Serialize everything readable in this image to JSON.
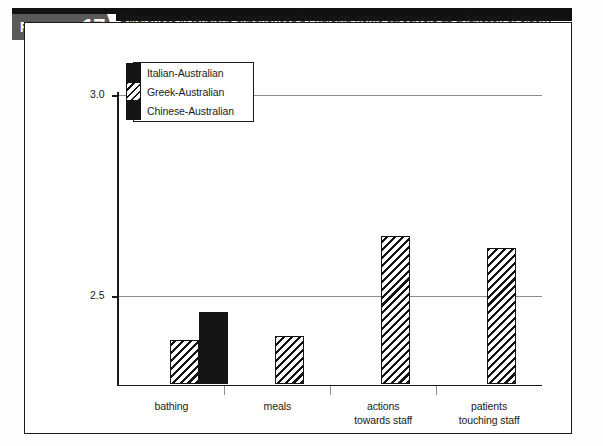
{
  "figure": {
    "badge_word": "FIGURE",
    "badge_number": "17.7",
    "caption": "Differences in tensions experienced by nursing-home caregivers as a function of elderly Australian residents' ethnicity"
  },
  "colors": {
    "series_solid": "#141414",
    "series_hatch_line": "#141414",
    "gridline": "#8d8d8d",
    "axis": "#1a1a1a",
    "badge_bg": "#5a5a5a",
    "header_band": "#111111"
  },
  "legend": {
    "items": [
      {
        "label": "Italian-Australian",
        "pattern": "solid"
      },
      {
        "label": "Greek-Australian",
        "pattern": "hatch"
      },
      {
        "label": "Chinese-Australian",
        "pattern": "solid"
      }
    ]
  },
  "axes": {
    "y_title": "mean score (frequency)",
    "y_ticks": [
      "3.0",
      "2.5",
      "2.0"
    ],
    "y_tick_values": [
      3.0,
      2.5,
      2.0
    ]
  },
  "chart_data": {
    "type": "bar",
    "title": "Differences in tensions experienced by nursing-home caregivers as a function of elderly Australian residents' ethnicity",
    "xlabel": "",
    "ylabel": "mean score (frequency)",
    "ylim": [
      1.8,
      3.05
    ],
    "yticks": [
      2.0,
      2.5,
      3.0
    ],
    "grid": true,
    "legend_position": "top-left inside plot",
    "categories": [
      "bathing",
      "meals",
      "actions towards staff",
      "patients touching staff"
    ],
    "category_lines": [
      [
        "bathing"
      ],
      [
        "meals"
      ],
      [
        "actions",
        "towards staff"
      ],
      [
        "patients",
        "touching staff"
      ]
    ],
    "series": [
      {
        "name": "Italian-Australian",
        "pattern": "solid",
        "values": [
          2.1,
          2.04,
          2.07,
          2.1
        ]
      },
      {
        "name": "Greek-Australian",
        "pattern": "hatch",
        "values": [
          2.39,
          2.4,
          2.65,
          2.62
        ]
      },
      {
        "name": "Chinese-Australian",
        "pattern": "solid",
        "values": [
          2.46,
          2.26,
          2.0,
          2.0
        ]
      }
    ]
  }
}
